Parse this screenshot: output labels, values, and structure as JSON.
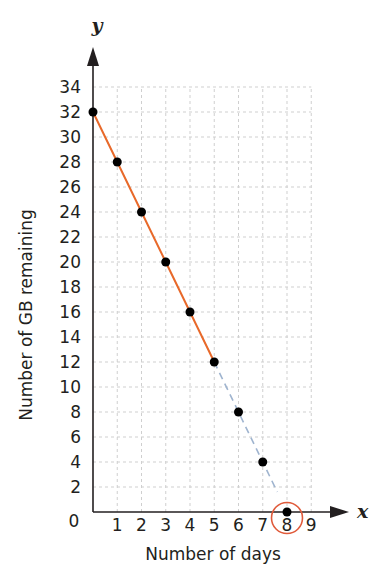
{
  "chart_data": {
    "type": "line",
    "title": "",
    "title_note": "title cropped at top edge of image",
    "xlabel": "Number of days",
    "ylabel": "Number of GB remaining",
    "x_axis_variable": "x",
    "y_axis_variable": "y",
    "xlim": [
      0,
      9
    ],
    "ylim": [
      0,
      34
    ],
    "x_ticks": [
      "1",
      "2",
      "3",
      "4",
      "5",
      "6",
      "7",
      "8",
      "9"
    ],
    "y_ticks": [
      "2",
      "4",
      "6",
      "8",
      "10",
      "12",
      "14",
      "16",
      "18",
      "20",
      "22",
      "24",
      "26",
      "28",
      "30",
      "32",
      "34"
    ],
    "origin_label": "0",
    "grid": true,
    "legend": null,
    "series": [
      {
        "name": "Data remaining (plotted)",
        "style": "solid",
        "color": "#e8692a",
        "x": [
          0,
          1,
          2,
          3,
          4,
          5
        ],
        "y": [
          32,
          28,
          24,
          20,
          16,
          12
        ]
      },
      {
        "name": "Data remaining (extrapolated)",
        "style": "dashed",
        "color": "#9fb4cf",
        "x": [
          5,
          6,
          7,
          8
        ],
        "y": [
          12,
          8,
          4,
          0
        ]
      }
    ],
    "points": [
      {
        "x": 0,
        "y": 32
      },
      {
        "x": 1,
        "y": 28
      },
      {
        "x": 2,
        "y": 24
      },
      {
        "x": 3,
        "y": 20
      },
      {
        "x": 4,
        "y": 16
      },
      {
        "x": 5,
        "y": 12
      },
      {
        "x": 6,
        "y": 8
      },
      {
        "x": 7,
        "y": 4
      },
      {
        "x": 8,
        "y": 0
      }
    ],
    "annotations": [
      {
        "type": "circle",
        "target": "x-intercept at x=8",
        "color": "#e05a3a"
      }
    ]
  },
  "colors": {
    "solid_line": "#e8692a",
    "dashed_line": "#9fb4cf",
    "highlight_circle": "#e05a3a",
    "grid": "#cfcfcf",
    "axis": "#231f20",
    "point": "#000000"
  }
}
